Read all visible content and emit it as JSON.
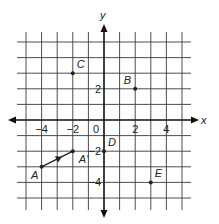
{
  "diagram": {
    "type": "coordinate-plane",
    "axes": {
      "x_label": "x",
      "y_label": "y",
      "x_range": [
        -5,
        5
      ],
      "y_range": [
        -5,
        5
      ],
      "x_ticks": [
        {
          "value": -4,
          "label": "−4"
        },
        {
          "value": -2,
          "label": "−2"
        },
        {
          "value": 0,
          "label": "0"
        },
        {
          "value": 2,
          "label": "2"
        },
        {
          "value": 4,
          "label": "4"
        }
      ],
      "y_ticks": [
        {
          "value": 2,
          "label": "2"
        },
        {
          "value": -2,
          "label": "−2"
        },
        {
          "value": -4,
          "label": "−4"
        }
      ]
    },
    "points": [
      {
        "name": "A",
        "x": -4,
        "y": -3,
        "label_pos": "below-left"
      },
      {
        "name": "A'",
        "x": -2,
        "y": -2,
        "label_pos": "below-right"
      },
      {
        "name": "B",
        "x": 2,
        "y": 2,
        "label_pos": "above-left"
      },
      {
        "name": "C",
        "x": -2,
        "y": 3,
        "label_pos": "above-right"
      },
      {
        "name": "D",
        "x": 0,
        "y": -2,
        "label_pos": "above-right"
      },
      {
        "name": "E",
        "x": 3,
        "y": -4,
        "label_pos": "above-right"
      }
    ],
    "vectors": [
      {
        "from": "A",
        "to": "A'",
        "arrow": "midpoint"
      }
    ],
    "colors": {
      "grid": "#3a3a3a",
      "axis": "#111111",
      "point": "#222222",
      "background": "#ffffff"
    }
  }
}
